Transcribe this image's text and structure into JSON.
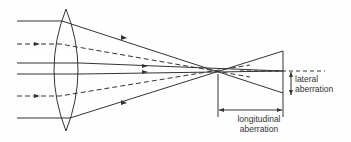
{
  "diagram": {
    "labels": {
      "lateral_line1": "lateral",
      "lateral_line2": "aberration",
      "longitudinal_line1": "longitudinal",
      "longitudinal_line2": "aberration"
    },
    "colors": {
      "line": "#333333",
      "background": "#fefefe"
    }
  }
}
